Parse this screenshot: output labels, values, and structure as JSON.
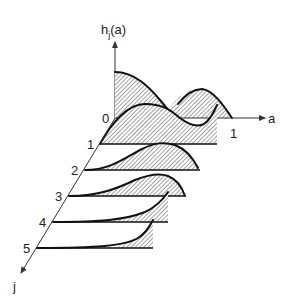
{
  "figure": {
    "type": "stacked-3d-density-plot",
    "axes": {
      "vertical_label": "h",
      "vertical_subscript": "j",
      "vertical_arg": "(a)",
      "horizontal_label": "a",
      "depth_label": "j",
      "origin_label": "0",
      "a_end_label": "1"
    },
    "rows": [
      {
        "j": "0",
        "shape": "decreasing from a=0 then second hump near a=0.8"
      },
      {
        "j": "1",
        "shape": "hump at a≈0.35, dip at a≈0.6, rises to a=1"
      },
      {
        "j": "2",
        "shape": "hump at a≈0.65, falls near a=1"
      },
      {
        "j": "3",
        "shape": "hump at a≈0.75, falls at a=1"
      },
      {
        "j": "4",
        "shape": "monotone rising toward a=1"
      },
      {
        "j": "5",
        "shape": "monotone rising toward a=1, flatter"
      }
    ],
    "row_labels": [
      "1",
      "2",
      "3",
      "4",
      "5"
    ],
    "colors": {
      "line": "#111111",
      "hatch": "#444444",
      "background": "#ffffff"
    }
  }
}
